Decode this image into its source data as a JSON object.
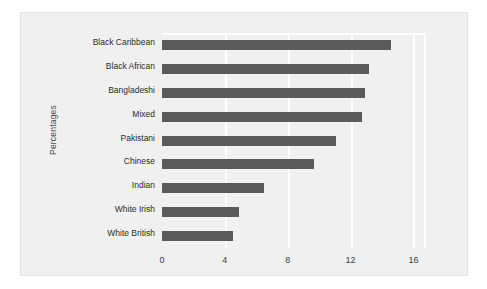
{
  "chart_data": {
    "type": "bar",
    "orientation": "horizontal",
    "title": "",
    "xlabel": "",
    "ylabel": "Percentages",
    "xlim": [
      0,
      16.8
    ],
    "xticks": [
      0,
      4,
      8,
      12,
      16
    ],
    "xtick_labels": [
      "0",
      "4",
      "8",
      "12",
      "16"
    ],
    "grid": true,
    "grid_axis": "x",
    "legend": false,
    "bar_color": "#5a5a5a",
    "panel_color": "#f0f0f0",
    "gridline_color": "#ffffff",
    "categories": [
      "Black Caribbean",
      "Black African",
      "Bangladeshi",
      "Mixed",
      "Pakistani",
      "Chinese",
      "Indian",
      "White Irish",
      "White British"
    ],
    "values": [
      14.6,
      13.2,
      12.9,
      12.7,
      11.1,
      9.7,
      6.5,
      4.9,
      4.5
    ]
  }
}
